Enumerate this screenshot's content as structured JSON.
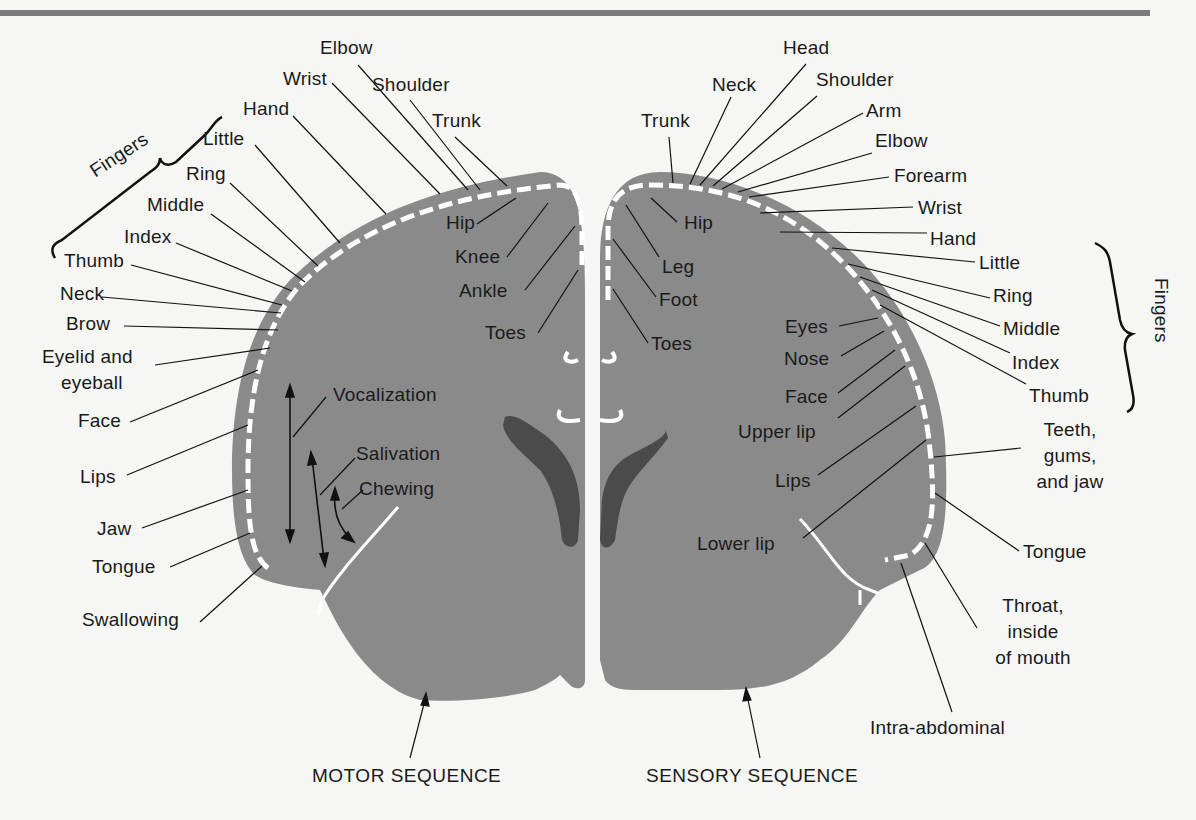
{
  "figure": {
    "type": "homunculus-map",
    "colors": {
      "background": "#f6f6f4",
      "cortex": "#8a8a8a",
      "ventricle": "#4b4b4b",
      "strip": "#ffffff",
      "text": "#1a1a1a",
      "header_bar": "#7c7c7c"
    }
  },
  "motor": {
    "caption": "MOTOR SEQUENCE",
    "fingers_label": "Fingers",
    "top_labels": [
      "Elbow",
      "Wrist",
      "Shoulder",
      "Hand",
      "Trunk",
      "Little",
      "Ring",
      "Middle",
      "Index",
      "Thumb"
    ],
    "side_labels": [
      "Neck",
      "Brow",
      "Eyelid and",
      "eyeball",
      "Face",
      "Lips",
      "Jaw",
      "Tongue",
      "Swallowing"
    ],
    "inner_labels": [
      "Hip",
      "Knee",
      "Ankle",
      "Toes"
    ],
    "function_labels": [
      "Vocalization",
      "Salivation",
      "Chewing"
    ]
  },
  "sensory": {
    "caption": "SENSORY SEQUENCE",
    "fingers_label": "Fingers",
    "top_labels": [
      "Head",
      "Neck",
      "Shoulder",
      "Trunk",
      "Arm",
      "Elbow",
      "Forearm",
      "Wrist",
      "Hand"
    ],
    "finger_labels": [
      "Little",
      "Ring",
      "Middle",
      "Index",
      "Thumb"
    ],
    "inner_labels": [
      "Hip",
      "Leg",
      "Foot",
      "Toes",
      "Eyes",
      "Nose",
      "Face",
      "Upper lip",
      "Lips",
      "Lower lip"
    ],
    "side_labels": [
      "Teeth,",
      "gums,",
      "and jaw",
      "Tongue",
      "Throat,",
      "inside",
      "of mouth",
      "Intra-abdominal"
    ]
  }
}
